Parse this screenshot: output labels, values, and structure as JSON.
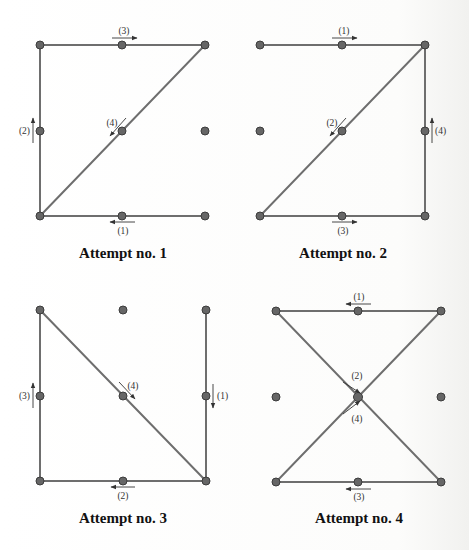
{
  "figure": {
    "type": "3x3 dot-grid stroke-order diagrams",
    "panels": [
      {
        "caption": "Attempt no. 1",
        "grid": {
          "x": [
            40,
            122,
            205
          ],
          "y": [
            45,
            131,
            216
          ]
        },
        "path": [
          [
            2,
            2
          ],
          [
            0,
            2
          ],
          [
            0,
            0
          ],
          [
            2,
            0
          ],
          [
            0,
            2
          ]
        ],
        "strokes": [
          {
            "label": "(1)",
            "direction": "left",
            "description": "bottom-right to bottom-left"
          },
          {
            "label": "(2)",
            "direction": "up",
            "description": "bottom-left to top-left"
          },
          {
            "label": "(3)",
            "direction": "right",
            "description": "top-left to top-right"
          },
          {
            "label": "(4)",
            "direction": "down-left",
            "description": "top-right diagonal to bottom-left"
          }
        ]
      },
      {
        "caption": "Attempt no. 2",
        "grid": {
          "x": [
            260,
            342,
            425
          ],
          "y": [
            45,
            131,
            216
          ]
        },
        "path": [
          [
            0,
            0
          ],
          [
            2,
            0
          ],
          [
            0,
            2
          ],
          [
            2,
            2
          ],
          [
            2,
            0
          ]
        ],
        "strokes": [
          {
            "label": "(1)",
            "direction": "right",
            "description": "top-left to top-right"
          },
          {
            "label": "(2)",
            "direction": "down-left",
            "description": "top-right diagonal to bottom-left"
          },
          {
            "label": "(3)",
            "direction": "right",
            "description": "bottom-left to bottom-right"
          },
          {
            "label": "(4)",
            "direction": "up",
            "description": "bottom-right to top-right"
          }
        ]
      },
      {
        "caption": "Attempt no. 3",
        "grid": {
          "x": [
            40,
            123,
            206
          ],
          "y": [
            310,
            396,
            481
          ]
        },
        "path": [
          [
            2,
            0
          ],
          [
            2,
            2
          ],
          [
            0,
            2
          ],
          [
            0,
            0
          ],
          [
            2,
            2
          ]
        ],
        "strokes": [
          {
            "label": "(1)",
            "direction": "down",
            "description": "top-right to bottom-right"
          },
          {
            "label": "(2)",
            "direction": "left",
            "description": "bottom-right to bottom-left"
          },
          {
            "label": "(3)",
            "direction": "up",
            "description": "bottom-left to top-left"
          },
          {
            "label": "(4)",
            "direction": "down-right",
            "description": "top-left diagonal to bottom-right"
          }
        ]
      },
      {
        "caption": "Attempt no. 4",
        "grid": {
          "x": [
            276,
            358,
            441
          ],
          "y": [
            311,
            397,
            482
          ]
        },
        "path": [
          [
            2,
            0
          ],
          [
            0,
            0
          ],
          [
            2,
            2
          ],
          [
            0,
            2
          ],
          [
            2,
            0
          ]
        ],
        "strokes": [
          {
            "label": "(1)",
            "direction": "left",
            "description": "top-right to top-left"
          },
          {
            "label": "(2)",
            "direction": "down-right",
            "description": "top-left diagonal through center to bottom-right"
          },
          {
            "label": "(3)",
            "direction": "left",
            "description": "bottom-right to bottom-left"
          },
          {
            "label": "(4)",
            "direction": "up-right",
            "description": "bottom-left diagonal through center to top-right"
          }
        ]
      }
    ],
    "colors": {
      "edge": "#6e6e6e",
      "dot": "#666666",
      "arrow": "#333333",
      "text": "#111111"
    }
  }
}
